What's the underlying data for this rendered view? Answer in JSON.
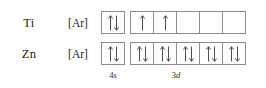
{
  "diagram": {
    "box_border_color": "#8c8c8c",
    "background_color": "#ffffff",
    "text_color": "#1a1a1a",
    "rows": [
      {
        "symbol": "Ti",
        "core": "[Ar]",
        "s_orbital": {
          "label": "4s",
          "boxes": [
            "updown"
          ]
        },
        "d_orbital": {
          "label": "3d",
          "boxes": [
            "up",
            "up",
            "empty",
            "empty",
            "empty"
          ]
        }
      },
      {
        "symbol": "Zn",
        "core": "[Ar]",
        "s_orbital": {
          "label": "4s",
          "boxes": [
            "updown"
          ]
        },
        "d_orbital": {
          "label": "3d",
          "boxes": [
            "updown",
            "updown",
            "updown",
            "updown",
            "updown"
          ]
        }
      }
    ],
    "captions": {
      "s": {
        "number": "4",
        "letter": "s"
      },
      "d": {
        "number": "3",
        "letter": "d"
      }
    }
  }
}
